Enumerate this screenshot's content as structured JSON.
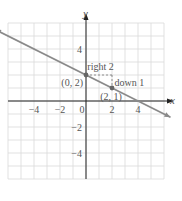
{
  "chart_data": {
    "type": "line",
    "title": "",
    "xlabel": "x",
    "ylabel": "y",
    "xlim": [
      -6,
      6
    ],
    "ylim": [
      -6,
      6
    ],
    "grid": true,
    "x_ticks": [
      -4,
      -2,
      0,
      2,
      4
    ],
    "y_ticks": [
      4,
      -2,
      -4
    ],
    "x_tick_labels": [
      "−4",
      "−2",
      "0",
      "2",
      "4"
    ],
    "y_tick_labels": [
      "4",
      "−2",
      "−4"
    ],
    "series": [
      {
        "name": "line",
        "slope": -0.5,
        "intercept": 2,
        "x": [
          -7,
          6.5
        ],
        "y": [
          5.5,
          -1.25
        ],
        "color": "#8a8a8a"
      }
    ],
    "points": [
      {
        "x": 0,
        "y": 2,
        "label": "(0, 2)"
      },
      {
        "x": 2,
        "y": 1,
        "label": "(2, 1)"
      }
    ],
    "annotations": [
      {
        "text": "right 2",
        "from": [
          0,
          2
        ],
        "to": [
          2,
          2
        ],
        "style": "dashed"
      },
      {
        "text": "down 1",
        "from": [
          2,
          2
        ],
        "to": [
          2,
          1
        ],
        "style": "dashed"
      }
    ],
    "colors": {
      "grid": "#d9d9d9",
      "axis": "#222222",
      "line": "#8a8a8a",
      "text": "#555555"
    }
  }
}
